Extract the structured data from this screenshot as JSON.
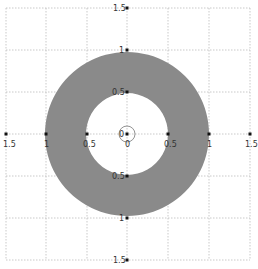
{
  "figure": {
    "type": "annulus-diagram",
    "center": [
      0,
      0
    ],
    "outer_radius": 1,
    "inner_radius": 0.5,
    "fill_color": "#8a8a8a",
    "grid_color": "#bbbbbb",
    "axis_range": [
      -1.5,
      1.5
    ],
    "grid_step": 0.5
  },
  "labels": {
    "x_left_1_5": "1.5",
    "x_left_1": "1",
    "x_left_0_5": "0.5",
    "x_zero": "0",
    "x_right_0_5": "0.5",
    "x_right_1": "1",
    "x_right_1_5": "1.5",
    "y_top_1_5": "1.5",
    "y_top_1": "1",
    "y_top_0_5": "0.5",
    "y_zero": "0",
    "y_bottom_0_5": "0.5",
    "y_bottom_1": "1",
    "y_bottom_1_5": "1.5"
  }
}
